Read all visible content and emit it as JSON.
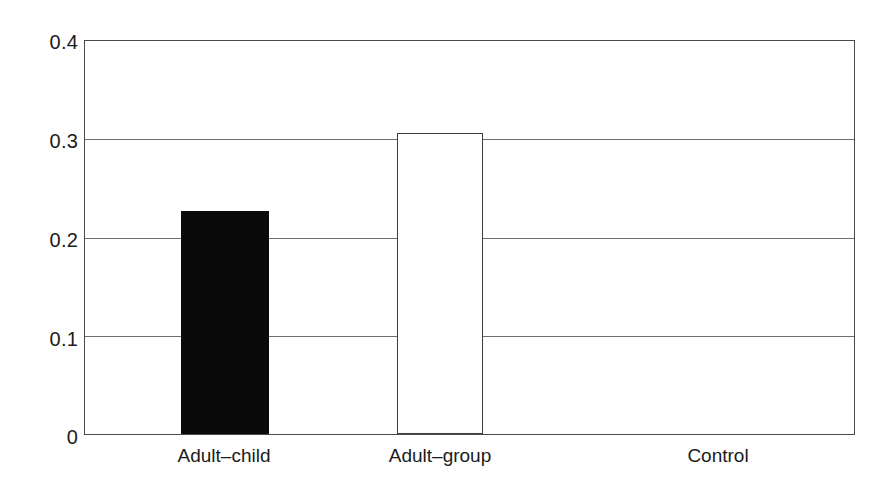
{
  "chart_data": {
    "type": "bar",
    "title": "",
    "subtitle": "",
    "xlabel": "",
    "ylabel": "",
    "categories": [
      "Adult–child",
      "Adult–group",
      "Control"
    ],
    "values": [
      0.227,
      0.306,
      0
    ],
    "series": [
      {
        "name": "",
        "values": [
          0.227,
          0.306,
          0
        ]
      }
    ],
    "ylim": [
      0,
      0.4
    ],
    "yticks": [
      0,
      0.1,
      0.2,
      0.3,
      0.4
    ],
    "ytick_labels": [
      "0",
      "0.1",
      "0.2",
      "0.3",
      "0.4"
    ],
    "xtick_labels": [
      "Adult–child",
      "Adult–group",
      "Control"
    ],
    "grid": true,
    "grid_axis": "y",
    "legend": false,
    "legend_position": "none",
    "annotations": [],
    "bar_styles": [
      "filled-black",
      "hollow-white",
      "none"
    ],
    "colors": {
      "bar_filled": "#0a0a0a",
      "bar_hollow_fill": "#ffffff",
      "bar_hollow_stroke": "#3d3d3d",
      "axis": "#4a4a4a",
      "gridline": "#6e6e6e",
      "text": "#1b1b1b",
      "background": "#ffffff"
    }
  },
  "axes": {
    "y_ticks": [
      {
        "label": "0.4",
        "value": 0.4
      },
      {
        "label": "0.3",
        "value": 0.3
      },
      {
        "label": "0.2",
        "value": 0.2
      },
      {
        "label": "0.1",
        "value": 0.1
      },
      {
        "label": "0",
        "value": 0
      }
    ],
    "x_ticks": [
      {
        "label": "Adult–child"
      },
      {
        "label": "Adult–group"
      },
      {
        "label": "Control"
      }
    ]
  }
}
